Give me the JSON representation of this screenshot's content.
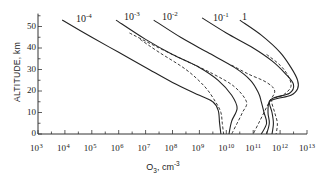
{
  "chart_data": {
    "type": "line",
    "title": "",
    "xlabel": "O3, cm-3",
    "xlabel_parts": {
      "base": "O",
      "sub": "3",
      "unit": ", cm",
      "exp": "-3"
    },
    "ylabel": "ALTITUDE, km",
    "xscale": "log",
    "xlim": [
      1000.0,
      10000000000000.0
    ],
    "ylim": [
      0,
      56
    ],
    "grid": false,
    "legend_position": "inline curve labels at top",
    "x_ticks": [
      {
        "base": "10",
        "exp": "3"
      },
      {
        "base": "10",
        "exp": "4"
      },
      {
        "base": "10",
        "exp": "5"
      },
      {
        "base": "10",
        "exp": "6"
      },
      {
        "base": "10",
        "exp": "7"
      },
      {
        "base": "10",
        "exp": "8"
      },
      {
        "base": "10",
        "exp": "9"
      },
      {
        "base": "10",
        "exp": "10"
      },
      {
        "base": "10",
        "exp": "11"
      },
      {
        "base": "10",
        "exp": "12"
      },
      {
        "base": "10",
        "exp": "13"
      }
    ],
    "y_ticks": [
      "0",
      "10",
      "20",
      "30",
      "40",
      "50"
    ],
    "series": [
      {
        "name": "10^-4",
        "label_base": "10",
        "label_exp": "-4",
        "style": "solid",
        "points": [
          [
            3.9,
            53
          ],
          [
            5.0,
            45
          ],
          [
            6.0,
            38
          ],
          [
            7.0,
            31
          ],
          [
            8.0,
            24
          ],
          [
            9.0,
            18
          ],
          [
            9.5,
            15
          ],
          [
            9.7,
            11
          ],
          [
            9.75,
            5
          ],
          [
            9.8,
            0
          ]
        ]
      },
      {
        "name": "10^-4 (alt)",
        "style": "dashed",
        "points": [
          [
            6.8,
            44
          ],
          [
            7.5,
            38
          ],
          [
            8.5,
            30
          ],
          [
            9.2,
            22
          ],
          [
            9.6,
            15
          ],
          [
            9.8,
            10
          ],
          [
            9.85,
            5
          ],
          [
            9.9,
            0
          ]
        ]
      },
      {
        "name": "10^-3",
        "label_base": "10",
        "label_exp": "-3",
        "style": "solid",
        "points": [
          [
            5.9,
            53
          ],
          [
            7.0,
            44
          ],
          [
            8.0,
            37
          ],
          [
            9.0,
            31
          ],
          [
            9.7,
            25
          ],
          [
            10.2,
            18
          ],
          [
            10.4,
            12
          ],
          [
            10.2,
            6
          ],
          [
            10.1,
            0
          ]
        ]
      },
      {
        "name": "10^-3 (alt)",
        "style": "dashed",
        "points": [
          [
            6.4,
            47
          ],
          [
            7.5,
            40
          ],
          [
            8.5,
            34
          ],
          [
            9.5,
            28
          ],
          [
            10.3,
            22
          ],
          [
            10.75,
            15
          ],
          [
            10.6,
            10
          ],
          [
            10.4,
            5
          ],
          [
            10.2,
            0
          ]
        ]
      },
      {
        "name": "10^-2",
        "label_base": "10",
        "label_exp": "-2",
        "style": "solid",
        "points": [
          [
            7.3,
            53
          ],
          [
            8.3,
            45
          ],
          [
            9.3,
            38
          ],
          [
            10.3,
            31
          ],
          [
            10.9,
            25
          ],
          [
            11.2,
            19
          ],
          [
            11.3,
            15
          ],
          [
            11.4,
            10
          ],
          [
            11.5,
            5
          ],
          [
            11.3,
            0
          ]
        ]
      },
      {
        "name": "10^-2 (alt)",
        "style": "dashed",
        "points": [
          [
            10.2,
            32
          ],
          [
            10.8,
            28
          ],
          [
            11.5,
            24
          ],
          [
            11.8,
            20
          ],
          [
            11.6,
            15
          ],
          [
            11.4,
            10
          ],
          [
            11.2,
            5
          ],
          [
            11.0,
            0
          ]
        ]
      },
      {
        "name": "10^-1",
        "label_base": "10",
        "label_exp": "-1",
        "style": "solid",
        "points": [
          [
            9.1,
            54
          ],
          [
            10.0,
            47
          ],
          [
            11.0,
            40
          ],
          [
            11.7,
            34
          ],
          [
            12.2,
            28
          ],
          [
            12.5,
            23
          ],
          [
            12.35,
            19
          ],
          [
            11.8,
            17
          ],
          [
            11.6,
            15
          ],
          [
            11.7,
            10
          ],
          [
            11.75,
            5
          ],
          [
            11.7,
            0
          ]
        ]
      },
      {
        "name": "10^-1 (alt)",
        "style": "dashed",
        "points": [
          [
            11.5,
            37
          ],
          [
            12.0,
            32
          ],
          [
            12.3,
            27
          ],
          [
            12.4,
            22
          ],
          [
            12.1,
            18
          ],
          [
            11.7,
            16
          ],
          [
            11.8,
            10
          ],
          [
            11.9,
            5
          ],
          [
            11.85,
            0
          ]
        ]
      },
      {
        "name": "1",
        "label_base": "1",
        "label_exp": "",
        "style": "solid",
        "points": [
          [
            10.5,
            53
          ],
          [
            11.3,
            46
          ],
          [
            12.0,
            38
          ],
          [
            12.4,
            31
          ],
          [
            12.65,
            25
          ],
          [
            12.65,
            21
          ],
          [
            12.4,
            18
          ],
          [
            11.9,
            16.5
          ],
          [
            11.6,
            15
          ],
          [
            11.55,
            10
          ],
          [
            11.6,
            5
          ],
          [
            11.5,
            0
          ]
        ]
      }
    ]
  },
  "axes": {
    "y_label": "ALTITUDE, km",
    "x_label_base": "O",
    "x_label_sub": "3",
    "x_label_unit": ", cm",
    "x_label_exp": "-3"
  },
  "curve_labels": [
    {
      "base": "10",
      "exp": "-4",
      "x": 76,
      "y": 13
    },
    {
      "base": "10",
      "exp": "-3",
      "x": 124,
      "y": 11
    },
    {
      "base": "10",
      "exp": "-2",
      "x": 162,
      "y": 11
    },
    {
      "base": "10",
      "exp": "-1",
      "x": 213,
      "y": 12
    },
    {
      "base": "1",
      "exp": "",
      "x": 242,
      "y": 12
    }
  ]
}
